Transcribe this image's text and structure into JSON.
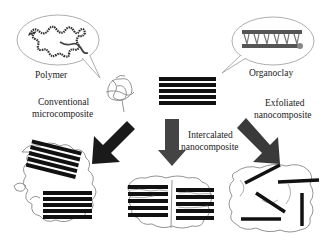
{
  "labels": {
    "polymer": "Polymer",
    "organoclay": "Organoclay",
    "conventional_line1": "Conventional",
    "conventional_line2": "microcomposite",
    "intercalated_line1": "Intercalated",
    "intercalated_line2": "nanocomposite",
    "exfoliated_line1": "Exfoliated",
    "exfoliated_line2": "nanocomposite"
  },
  "colors": {
    "clay_layer": "#111111",
    "polymer_chain": "#777777",
    "arrow_dark": "#1a1a1a",
    "arrow_mid": "#444444",
    "arrow_right": "#3a3a3a",
    "bubble_outline": "#888888"
  },
  "diagram": {
    "nodes": [
      "Polymer",
      "Organoclay",
      "Conventional microcomposite",
      "Intercalated nanocomposite",
      "Exfoliated nanocomposite"
    ],
    "edges": [
      {
        "from": "Polymer + Organoclay",
        "to": "Conventional microcomposite"
      },
      {
        "from": "Polymer + Organoclay",
        "to": "Intercalated nanocomposite"
      },
      {
        "from": "Polymer + Organoclay",
        "to": "Exfoliated nanocomposite"
      }
    ]
  }
}
